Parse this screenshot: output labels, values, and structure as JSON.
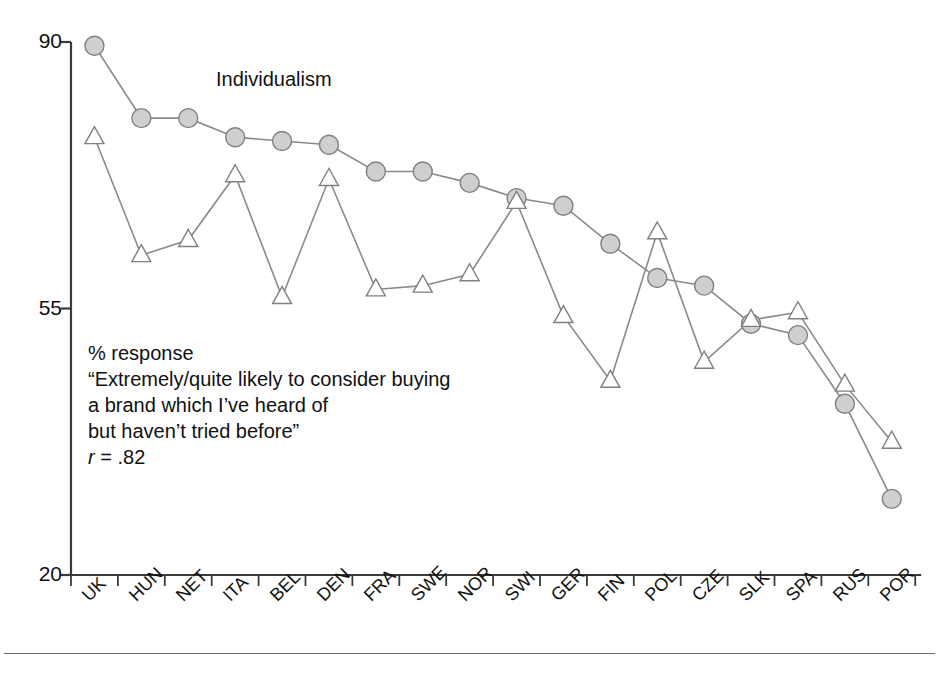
{
  "figure": {
    "series_label": "Individualism",
    "footer_rule": "horizontal-rule"
  },
  "annotation": {
    "line1": "% response",
    "line2": "“Extremely/quite likely to consider buying",
    "line3": "a brand which I’ve heard of",
    "line4": "but haven’t tried before”",
    "line5_prefix": "r",
    "line5_rest": " = .82"
  },
  "colors": {
    "marker_fill": "#cfcfcf",
    "marker_stroke": "#808080",
    "line": "#8a8a8a",
    "axis": "#3a3a3a",
    "text": "#111111"
  },
  "chart_data": {
    "type": "line",
    "title": "",
    "xlabel": "",
    "ylabel": "",
    "ylim": [
      20,
      90
    ],
    "yticks": [
      20,
      55,
      90
    ],
    "ytick_labels": [
      "20",
      "55",
      "90"
    ],
    "grid": false,
    "legend_position": "inline-annotation",
    "categories": [
      "UK",
      "HUN",
      "NET",
      "ITA",
      "BEL",
      "DEN",
      "FRA",
      "SWE",
      "NOR",
      "SWI",
      "GER",
      "FIN",
      "POL",
      "CZE",
      "SLK",
      "SPA",
      "RUS",
      "POR"
    ],
    "series": [
      {
        "name": "Individualism",
        "marker": "circle-filled",
        "values": [
          89.5,
          80.0,
          80.0,
          77.5,
          77.0,
          76.5,
          73.0,
          73.0,
          71.5,
          69.5,
          68.5,
          63.5,
          59.0,
          58.0,
          53.0,
          51.5,
          42.5,
          30.0
        ]
      },
      {
        "name": "% response",
        "marker": "triangle-open",
        "values": [
          77.5,
          62.0,
          64.0,
          72.5,
          56.5,
          72.0,
          57.5,
          58.0,
          59.5,
          69.0,
          54.0,
          45.5,
          65.0,
          48.0,
          53.5,
          54.5,
          45.0,
          37.5
        ]
      }
    ],
    "r_value": 0.82
  }
}
